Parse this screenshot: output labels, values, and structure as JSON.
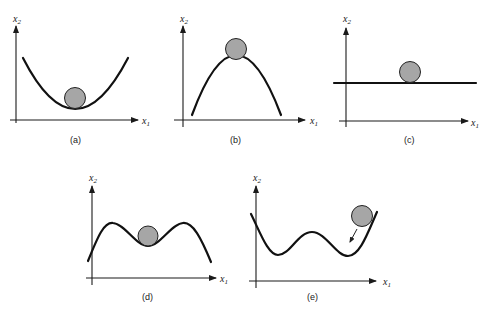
{
  "figure": {
    "axis_labels": {
      "x_var": "x",
      "x_sub": "1",
      "y_var": "x",
      "y_sub": "2"
    },
    "panels": [
      {
        "id": "a",
        "caption": "(a)",
        "description": "stable equilibrium: ball at bottom of a bowl"
      },
      {
        "id": "b",
        "caption": "(b)",
        "description": "unstable equilibrium: ball on top of a hill"
      },
      {
        "id": "c",
        "caption": "(c)",
        "description": "neutral equilibrium: ball on a flat line"
      },
      {
        "id": "d",
        "caption": "(d)",
        "description": "ball in local minimum between two peaks"
      },
      {
        "id": "e",
        "caption": "(e)",
        "description": "ball rolling into a local minimum of a double-well"
      }
    ],
    "colors": {
      "curve": "#111111",
      "ball_fill": "#a6a6a6",
      "background": "#ffffff"
    }
  }
}
